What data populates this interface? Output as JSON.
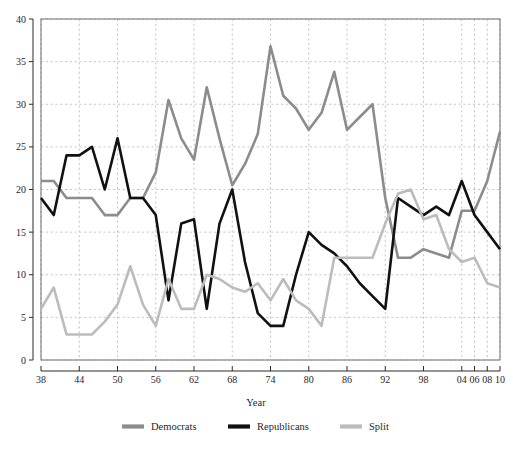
{
  "chart_data": {
    "type": "line",
    "title": "",
    "xlabel": "Year",
    "ylabel": "",
    "xlim": [
      1938,
      2010
    ],
    "ylim": [
      0,
      40
    ],
    "grid": true,
    "legend_position": "bottom",
    "x_tick_labels": [
      "38",
      "44",
      "50",
      "56",
      "62",
      "68",
      "74",
      "80",
      "86",
      "92",
      "98",
      "04",
      "06",
      "08",
      "10"
    ],
    "x_tick_values": [
      1938,
      1944,
      1950,
      1956,
      1962,
      1968,
      1974,
      1980,
      1986,
      1992,
      1998,
      2004,
      2006,
      2008,
      2010
    ],
    "y_tick_labels": [
      "0",
      "5",
      "10",
      "15",
      "20",
      "25",
      "30",
      "35",
      "40"
    ],
    "y_tick_values": [
      0,
      5,
      10,
      15,
      20,
      25,
      30,
      35,
      40
    ],
    "x": [
      1938,
      1940,
      1942,
      1944,
      1946,
      1948,
      1950,
      1952,
      1954,
      1956,
      1958,
      1960,
      1962,
      1964,
      1966,
      1968,
      1970,
      1972,
      1974,
      1976,
      1978,
      1980,
      1982,
      1984,
      1986,
      1988,
      1990,
      1992,
      1994,
      1996,
      1998,
      2000,
      2002,
      2004,
      2006,
      2008,
      2010
    ],
    "series": [
      {
        "name": "Democrats",
        "color": "#8c8c8c",
        "values": [
          21,
          21,
          19,
          19,
          19,
          17,
          17,
          19,
          19,
          22,
          30.5,
          26,
          23.5,
          32,
          26,
          20.5,
          23,
          26.5,
          36.8,
          31,
          29.5,
          27,
          29,
          33.8,
          27,
          28.5,
          30,
          19,
          12,
          12,
          13,
          12.5,
          12,
          17.5,
          17.5,
          21,
          26.8
        ]
      },
      {
        "name": "Republicans",
        "color": "#111111",
        "values": [
          19,
          17,
          24,
          24,
          25,
          20,
          26,
          19,
          19,
          17,
          7,
          16,
          16.5,
          6,
          16,
          20,
          11.5,
          5.5,
          4,
          4,
          10,
          15,
          13.5,
          12.5,
          11,
          9,
          7.5,
          6,
          19,
          18,
          17,
          18,
          17,
          21,
          17,
          15,
          13
        ]
      },
      {
        "name": "Split",
        "color": "#bcbcbc",
        "values": [
          6,
          8.5,
          3,
          3,
          3,
          4.5,
          6.5,
          11,
          6.5,
          4,
          9.5,
          6,
          6,
          10,
          9.5,
          8.5,
          8,
          9,
          7,
          9.5,
          7,
          6,
          4,
          12,
          12,
          12,
          12,
          16,
          19.5,
          20,
          16.5,
          17,
          13,
          11.5,
          12,
          9,
          8.5
        ]
      }
    ]
  },
  "legend": {
    "items": [
      {
        "label": "Democrats",
        "color": "#8c8c8c"
      },
      {
        "label": "Republicans",
        "color": "#111111"
      },
      {
        "label": "Split",
        "color": "#bcbcbc"
      }
    ]
  },
  "axis": {
    "x_title": "Year"
  }
}
